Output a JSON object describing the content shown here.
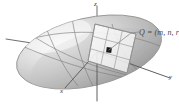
{
  "figure": {
    "background_color": "#ffffff",
    "axes": {
      "x_label": "x",
      "y_label": "y",
      "z_label": "z",
      "axis_color": "#6b6b6b"
    },
    "point": {
      "name": "Q",
      "label": "Q = (m, n, r",
      "label_parts": {
        "symbol": "Q",
        "equals": " = ",
        "coordinates": "(m, n, r"
      },
      "marker_color": "#1a1a1a"
    },
    "surface": {
      "kind": "ellipsoid",
      "fill_light": "#f2f2f2",
      "fill_mid": "#c9c9c9",
      "fill_dark": "#9a9a9a",
      "outline_color": "#8a8a8a"
    },
    "tangent_plane": {
      "kind": "grid-patch",
      "rows": 3,
      "columns": 3,
      "fill_color": "#f4f4f4",
      "line_color": "#9b9b9b"
    },
    "leader_line": {
      "color": "#8c8c8c"
    }
  }
}
